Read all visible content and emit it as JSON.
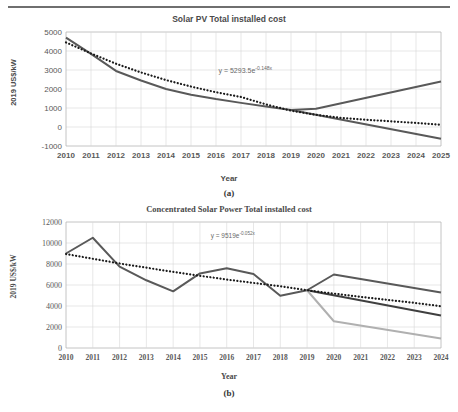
{
  "page": {
    "corner_mark": "",
    "figures": [
      {
        "id": "a",
        "caption": "(a)",
        "title": "Solar PV Total installed cost",
        "xlabel": "Year",
        "ylabel": "2019 US$/kW",
        "equation_prefix": "y = 5293.5e",
        "equation_exponent": "-0.148x"
      },
      {
        "id": "b",
        "caption": "(b)",
        "title": "Concentrated Solar Power Total installed cost",
        "xlabel": "Year",
        "ylabel": "2019 US$/kW",
        "equation_prefix": "y = 9519e",
        "equation_exponent": "-0.052x"
      }
    ]
  },
  "chart_data": [
    {
      "type": "line",
      "title": "Solar PV Total installed cost",
      "xlabel": "Year",
      "ylabel": "2019 US$/kW",
      "categories": [
        2010,
        2011,
        2012,
        2013,
        2014,
        2015,
        2016,
        2017,
        2018,
        2019,
        2020,
        2021,
        2022,
        2023,
        2024,
        2025
      ],
      "xtick_labels": [
        "2010",
        "2011",
        "2012",
        "2013",
        "2014",
        "2015",
        "2016",
        "2017",
        "2018",
        "2019",
        "2020",
        "2021",
        "2022",
        "2023",
        "2024",
        "2025"
      ],
      "ylim": [
        -1000,
        5000
      ],
      "ytick_labels": [
        "5000",
        "4000",
        "3000",
        "2000",
        "1000",
        "0",
        "-1000"
      ],
      "yticks": [
        5000,
        4000,
        3000,
        2000,
        1000,
        0,
        -1000
      ],
      "grid": true,
      "legend": "none",
      "annotations": [
        {
          "text": "y = 5293.5e^-0.148x",
          "x": 2016.1,
          "y": 3250
        }
      ],
      "series": [
        {
          "name": "Historical installed cost",
          "style": "solid",
          "color": "#595959",
          "width": 2.0,
          "x": [
            2010,
            2011,
            2012,
            2013,
            2014,
            2015,
            2016,
            2017,
            2018,
            2019
          ],
          "values": [
            4700,
            3850,
            2950,
            2450,
            2000,
            1700,
            1470,
            1270,
            1080,
            900
          ]
        },
        {
          "name": "Upper projection",
          "style": "solid",
          "color": "#595959",
          "width": 2.0,
          "x": [
            2019,
            2020,
            2025
          ],
          "values": [
            900,
            960,
            2400
          ]
        },
        {
          "name": "Lower projection",
          "style": "solid",
          "color": "#595959",
          "width": 2.0,
          "x": [
            2019,
            2025
          ],
          "values": [
            900,
            -620
          ]
        },
        {
          "name": "Exponential trendline",
          "style": "dotted",
          "color": "#1a1a1a",
          "width": 2.2,
          "x": [
            2010,
            2011,
            2012,
            2013,
            2014,
            2015,
            2016,
            2017,
            2018,
            2019,
            2020,
            2021,
            2022,
            2023,
            2024,
            2025
          ],
          "values": [
            4450,
            3870,
            3330,
            2870,
            2470,
            2130,
            1830,
            1580,
            1190,
            860,
            640,
            480,
            380,
            300,
            210,
            120
          ]
        }
      ]
    },
    {
      "type": "line",
      "title": "Concentrated Solar Power Total installed cost",
      "xlabel": "Year",
      "ylabel": "2019 US$/kW",
      "categories": [
        2010,
        2011,
        2012,
        2013,
        2014,
        2015,
        2016,
        2017,
        2018,
        2019,
        2020,
        2021,
        2022,
        2023,
        2024
      ],
      "xtick_labels": [
        "2010",
        "2011",
        "2012",
        "2013",
        "2014",
        "2015",
        "2016",
        "2017",
        "2018",
        "2019",
        "2020",
        "2021",
        "2022",
        "2023",
        "2024"
      ],
      "ylim": [
        0,
        12000
      ],
      "ytick_labels": [
        "12000",
        "10000",
        "8000",
        "6000",
        "4000",
        "2000",
        "0"
      ],
      "yticks": [
        12000,
        10000,
        8000,
        6000,
        4000,
        2000,
        0
      ],
      "grid": true,
      "legend": "none",
      "annotations": [
        {
          "text": "y = 9519e^-0.052x",
          "x": 2015.4,
          "y": 11100
        }
      ],
      "series": [
        {
          "name": "Historical installed cost",
          "style": "solid",
          "color": "#595959",
          "width": 2.0,
          "x": [
            2010,
            2011,
            2012,
            2013,
            2014,
            2015,
            2016,
            2017,
            2018,
            2019
          ],
          "values": [
            9000,
            10500,
            7750,
            6450,
            5400,
            7100,
            7600,
            7050,
            4980,
            5500
          ]
        },
        {
          "name": "Upper projection",
          "style": "solid",
          "color": "#595959",
          "width": 2.0,
          "x": [
            2019,
            2020,
            2024
          ],
          "values": [
            5500,
            7000,
            5280
          ]
        },
        {
          "name": "Middle projection",
          "style": "solid",
          "color": "#3f3f3f",
          "width": 2.0,
          "x": [
            2019,
            2024
          ],
          "values": [
            5500,
            3100
          ]
        },
        {
          "name": "Low projection",
          "style": "solid",
          "color": "#b0b0b0",
          "width": 2.0,
          "x": [
            2019,
            2020,
            2024
          ],
          "values": [
            5500,
            2550,
            900
          ]
        },
        {
          "name": "Exponential trendline",
          "style": "dotted",
          "color": "#1a1a1a",
          "width": 2.2,
          "x": [
            2010,
            2011,
            2012,
            2013,
            2014,
            2015,
            2016,
            2017,
            2018,
            2019,
            2020,
            2021,
            2022,
            2023,
            2024
          ],
          "values": [
            8950,
            8500,
            8050,
            7650,
            7250,
            6880,
            6520,
            6200,
            5880,
            5500,
            5180,
            4870,
            4580,
            4300,
            3980
          ]
        }
      ]
    }
  ]
}
